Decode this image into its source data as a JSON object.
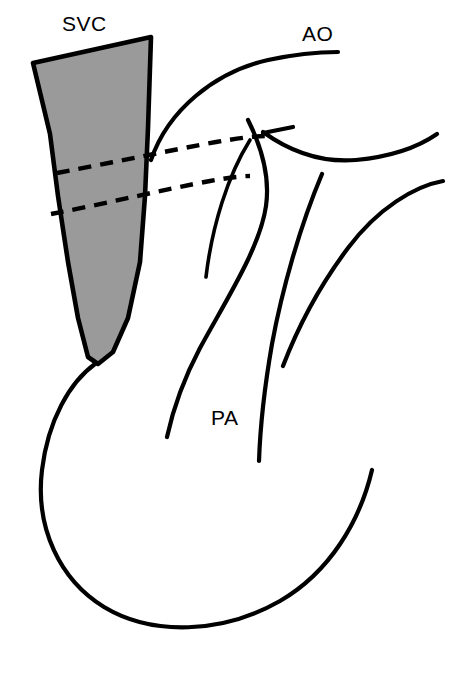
{
  "figure": {
    "kind": "anatomical-line-diagram",
    "background_color": "#ffffff",
    "line_color": "#000000",
    "shaded_region_color": "#9a9a9a"
  },
  "labels": {
    "svc": "SVC",
    "ao": "AO",
    "pa": "PA"
  },
  "label_positions": {
    "svc": {
      "x": 62,
      "y": 31
    },
    "ao": {
      "x": 302,
      "y": 41
    },
    "pa": {
      "x": 211,
      "y": 425
    }
  },
  "structures": {
    "svc_shaded": {
      "name": "superior-vena-cava",
      "fill": "#9a9a9a",
      "outline": "solid",
      "path": "M 33 63 L 151 37 L 148 128 L 145 196 L 140 262 L 128 318 L 113 352 L 98 364 L 88 357 L 78 318 L 68 262 L 58 196 L 50 134 Z"
    },
    "aortic_arch": {
      "name": "aorta",
      "style": "solid",
      "path": "M 151 160 C 168 110, 215 72, 268 60 C 296 54, 320 52, 338 52"
    },
    "aorta_right_branch": {
      "name": "aorta-descending-branch",
      "style": "solid",
      "path": "M 263 132 C 288 150, 320 163, 356 160 C 398 156, 424 143, 437 134"
    },
    "branch_stub": {
      "name": "brachiocephalic-stub",
      "style": "solid",
      "path": "M 263 133 L 293 127"
    },
    "right_outer_wall": {
      "name": "right-heart-border",
      "style": "solid",
      "path": "M 443 181 C 415 186, 378 208, 348 248 C 318 288, 296 332, 283 366"
    },
    "pa_left_short": {
      "name": "pulmonary-artery-left-wall",
      "style": "solid",
      "path": "M 250 140 C 228 175, 212 226, 206 277"
    },
    "pa_long_s_curve": {
      "name": "pulmonary-artery-main-trunk",
      "style": "solid",
      "path": "M 248 120 C 262 148, 270 178, 266 206 C 260 248, 226 300, 200 348 C 182 382, 172 414, 167 437"
    },
    "pa_right_wall": {
      "name": "pulmonary-artery-right-wall",
      "style": "solid",
      "path": "M 322 174 C 300 226, 282 290, 272 344 C 264 390, 260 432, 259 461"
    },
    "atrium_outline": {
      "name": "right-atrium-border",
      "style": "solid",
      "path": "M 95 364 C 70 382, 48 420, 42 470 C 35 528, 60 580, 104 607 C 152 636, 222 634, 280 601 C 330 572, 360 521, 372 470"
    },
    "hidden_contour_upper": {
      "name": "hidden-contour-upper",
      "style": "dashed",
      "path": "M 57 173 C 110 163, 172 150, 216 142 C 240 138, 256 136, 266 136"
    },
    "hidden_contour_lower": {
      "name": "hidden-contour-lower",
      "style": "dashed",
      "path": "M 51 214 C 104 204, 166 189, 210 181 C 232 177, 244 176, 250 176"
    }
  }
}
